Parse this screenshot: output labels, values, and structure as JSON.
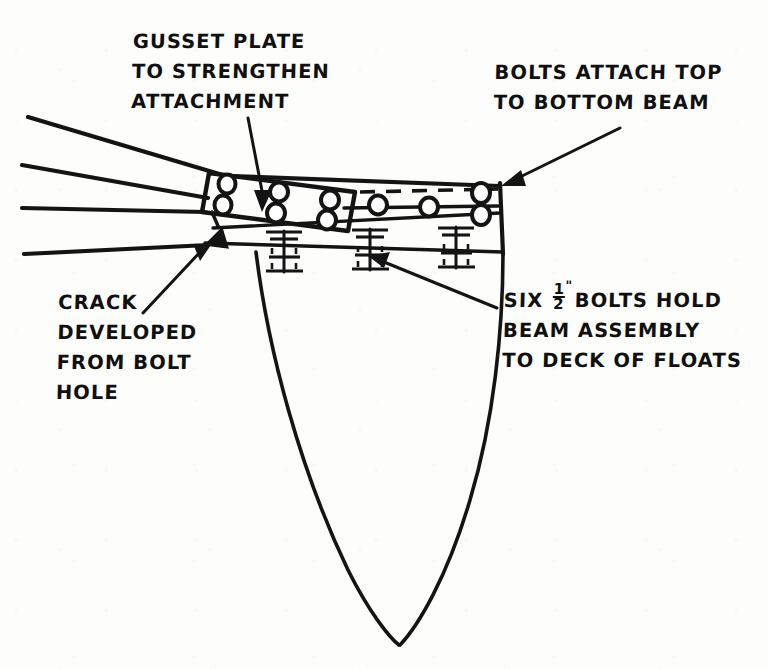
{
  "document": {
    "kind": "hand-drawn engineering sketch",
    "subject": "Floatplane float beam attachment detail",
    "ink_color": "#141414",
    "paper_color": "#fdfdfc"
  },
  "annotations": [
    {
      "id": "gusset-plate-note",
      "lines": [
        "GUSSET PLATE",
        "TO STRENGTHEN",
        "ATTACHMENT"
      ],
      "leader": {
        "from": [
          248,
          118
        ],
        "to": [
          262,
          207
        ],
        "arrow": "down-right"
      }
    },
    {
      "id": "bolts-attach-note",
      "lines": [
        "BOLTS ATTACH TOP",
        "TO BOTTOM BEAM"
      ],
      "leader": {
        "from": [
          612,
          126
        ],
        "to": [
          503,
          182
        ],
        "arrow": "down-left"
      }
    },
    {
      "id": "crack-note",
      "lines": [
        "CRACK",
        "DEVELOPED",
        "FROM BOLT",
        "HOLE"
      ],
      "leader": {
        "from": [
          143,
          313
        ],
        "to": [
          212,
          246
        ],
        "arrow": "up-right"
      }
    },
    {
      "id": "six-bolts-note",
      "lines": [
        "SIX %FRAC% BOLTS HOLD",
        "BEAM ASSEMBLY",
        "TO DECK OF FLOATS"
      ],
      "fraction": {
        "numerator": "1",
        "denominator": "2",
        "unit": "\""
      },
      "leader": {
        "from": [
          497,
          308
        ],
        "to": [
          369,
          256
        ],
        "arrow": "up-left"
      }
    }
  ],
  "parts": {
    "gusset_plate": {
      "label": "gusset plate",
      "hole_count": 6,
      "hole_rows": 2,
      "hole_columns": 3
    },
    "top_beam": {
      "label": "top beam",
      "right_section_hole_count": 3,
      "end_hole_count": 2,
      "dashed_edge": true
    },
    "beam_lines_to_left_edge": 4,
    "deck_bolts": {
      "label": "bolts to float deck",
      "count_visible": 3,
      "size": "1/2 inch"
    },
    "float_hull": {
      "label": "float hull / deck",
      "shape": "vee-bottom profile"
    },
    "crack": {
      "label": "crack developed from bolt hole",
      "marker": "filled wedge"
    }
  }
}
